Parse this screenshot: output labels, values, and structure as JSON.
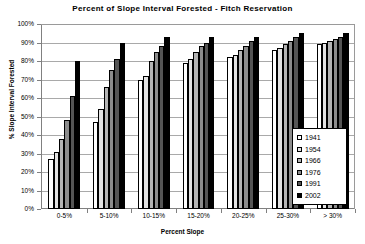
{
  "chart_data": {
    "type": "bar",
    "title": "Percent of Slope Interval Forested - Fitch Reservation",
    "xlabel": "Percent Slope",
    "ylabel": "% Slope Interval Forested",
    "categories": [
      "0-5%",
      "5-10%",
      "10-15%",
      "15-20%",
      "20-25%",
      "25-30%",
      "> 30%"
    ],
    "ylim": [
      0,
      100
    ],
    "ytick_labels": [
      "0%",
      "10%",
      "20%",
      "30%",
      "40%",
      "50%",
      "60%",
      "70%",
      "80%",
      "90%",
      "100%"
    ],
    "ytick_values": [
      0,
      10,
      20,
      30,
      40,
      50,
      60,
      70,
      80,
      90,
      100
    ],
    "grid": true,
    "legend_position": "bottom-right",
    "series": [
      {
        "name": "1941",
        "color": "#ffffff",
        "values": [
          27,
          47,
          70,
          79,
          82,
          86,
          89
        ]
      },
      {
        "name": "1954",
        "color": "#e3e3e3",
        "values": [
          31,
          54,
          72,
          81,
          83,
          87,
          90
        ]
      },
      {
        "name": "1966",
        "color": "#b4b4b4",
        "values": [
          38,
          66,
          80,
          85,
          86,
          89,
          91
        ]
      },
      {
        "name": "1976",
        "color": "#8c8c8c",
        "values": [
          48,
          75,
          85,
          88,
          88,
          91,
          92
        ]
      },
      {
        "name": "1991",
        "color": "#555555",
        "values": [
          61,
          81,
          88,
          90,
          91,
          93,
          93
        ]
      },
      {
        "name": "2002",
        "color": "#000000",
        "values": [
          80,
          90,
          93,
          93,
          93,
          95,
          95
        ]
      }
    ]
  }
}
